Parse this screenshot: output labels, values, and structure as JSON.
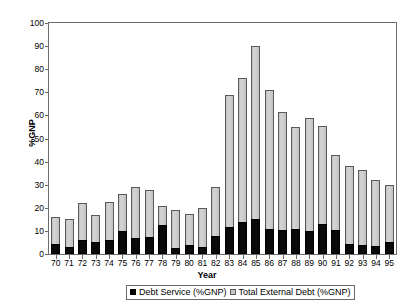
{
  "chart_data": {
    "type": "bar",
    "title": "",
    "subtitle": "",
    "xlabel": "Year",
    "ylabel": "%GNP",
    "ylim": [
      0,
      100
    ],
    "ytick_step": 10,
    "grid": false,
    "legend_position": "bottom",
    "stacked_overlay": true,
    "categories": [
      "70",
      "71",
      "72",
      "73",
      "74",
      "75",
      "76",
      "77",
      "78",
      "79",
      "80",
      "81",
      "82",
      "83",
      "84",
      "85",
      "86",
      "87",
      "88",
      "89",
      "90",
      "91",
      "92",
      "93",
      "94",
      "95"
    ],
    "yticks": [
      "0",
      "10",
      "20",
      "30",
      "40",
      "50",
      "60",
      "70",
      "80",
      "90",
      "100"
    ],
    "series": [
      {
        "name": "Debt Service (%GNP)",
        "color": "#000000",
        "values": [
          4.5,
          3.0,
          6.0,
          5.0,
          6.0,
          10.0,
          7.0,
          7.5,
          12.5,
          2.5,
          3.8,
          3.2,
          8.0,
          11.5,
          14.0,
          15.0,
          11.0,
          10.5,
          11.0,
          10.0,
          13.0,
          10.5,
          4.5,
          4.0,
          3.5,
          5.0
        ]
      },
      {
        "name": "Total External Debt (%GNP)",
        "color": "#c9c9c9",
        "values": [
          16.0,
          15.2,
          22.0,
          17.0,
          22.5,
          26.0,
          29.0,
          27.5,
          21.0,
          19.0,
          17.5,
          20.0,
          29.0,
          69.0,
          76.0,
          90.0,
          71.0,
          61.5,
          55.0,
          59.0,
          55.5,
          43.0,
          38.0,
          36.5,
          32.0,
          30.0
        ]
      }
    ]
  },
  "legend": {
    "items": [
      {
        "label": "Debt Service (%GNP)",
        "swatch": "black-square-icon"
      },
      {
        "label": "Total External Debt (%GNP)",
        "swatch": "gray-square-icon"
      }
    ]
  },
  "axes": {
    "y_title": "%GNP",
    "x_title": "Year"
  }
}
